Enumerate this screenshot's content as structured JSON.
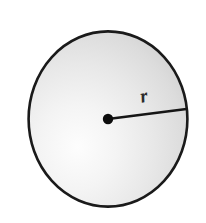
{
  "figure": {
    "kind": "geometry-diagram",
    "background_color": "#ffffff",
    "labels": {
      "radius": "r"
    },
    "circle": {
      "center_x": 108,
      "center_y": 119,
      "radius_x": 80,
      "radius_y": 88,
      "outline_color": "#1a1a1a",
      "outline_width": 2.6,
      "fill_light": "#fcfcfc",
      "fill_mid": "#e3e3e3",
      "fill_dark": "#c9c9c9",
      "highlight_x": 78,
      "highlight_y": 150
    },
    "center_dot": {
      "x": 108,
      "y": 119,
      "r": 5.2,
      "color": "#0d0d0d"
    },
    "radius_line": {
      "x1": 108,
      "y1": 119,
      "x2": 186,
      "y2": 109,
      "color": "#161616",
      "width": 2.6
    },
    "radius_label_position": {
      "x": 145,
      "y": 102,
      "rotation": -12
    }
  }
}
